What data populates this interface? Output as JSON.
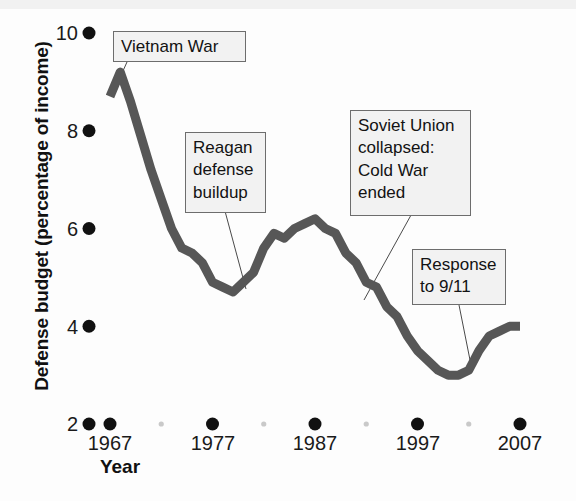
{
  "chart_data": {
    "type": "line",
    "title": "",
    "xlabel": "Year",
    "ylabel": "Defense budget (percentage of income)",
    "xlim": [
      1967,
      2007
    ],
    "ylim": [
      2,
      10
    ],
    "xticks": [
      1967,
      1977,
      1987,
      1997,
      2007
    ],
    "xtick_labels": [
      "1967",
      "1977",
      "1987",
      "1997",
      "2007"
    ],
    "yticks": [
      2,
      4,
      6,
      8,
      10
    ],
    "ytick_labels": [
      "2",
      "4",
      "6",
      "8",
      "10"
    ],
    "minor_xticks": [
      1972,
      1982,
      1992,
      2002
    ],
    "grid": false,
    "legend": null,
    "series": [
      {
        "name": "Defense budget",
        "color": "#575757",
        "x": [
          1967,
          1968,
          1969,
          1970,
          1971,
          1972,
          1973,
          1974,
          1975,
          1976,
          1977,
          1978,
          1979,
          1980,
          1981,
          1982,
          1983,
          1984,
          1985,
          1986,
          1987,
          1988,
          1989,
          1990,
          1991,
          1992,
          1993,
          1994,
          1995,
          1996,
          1997,
          1998,
          1999,
          2000,
          2001,
          2002,
          2003,
          2004,
          2005,
          2006,
          2007
        ],
        "y": [
          8.7,
          9.2,
          8.6,
          7.9,
          7.2,
          6.6,
          6.0,
          5.6,
          5.5,
          5.3,
          4.9,
          4.8,
          4.7,
          4.9,
          5.1,
          5.6,
          5.9,
          5.8,
          6.0,
          6.1,
          6.2,
          6.0,
          5.9,
          5.5,
          5.3,
          4.9,
          4.8,
          4.4,
          4.2,
          3.8,
          3.5,
          3.3,
          3.1,
          3.0,
          3.0,
          3.1,
          3.5,
          3.8,
          3.9,
          4.0,
          4.0
        ]
      }
    ],
    "annotations": [
      {
        "id": "vietnam-war",
        "text": "Vietnam War",
        "box": {
          "x": 113,
          "y": 31,
          "width": 133,
          "height": 31
        },
        "leader_to": {
          "x": 118,
          "y": 82
        }
      },
      {
        "id": "reagan-defense-buildup",
        "text": "Reagan\ndefense\nbuildup",
        "box": {
          "x": 185,
          "y": 132,
          "width": 81,
          "height": 81
        },
        "leader_to": {
          "x": 246,
          "y": 289
        }
      },
      {
        "id": "soviet-union-collapsed",
        "text": "Soviet Union\ncollapsed:\nCold War\nended",
        "box": {
          "x": 350,
          "y": 110,
          "width": 121,
          "height": 106
        },
        "leader_to": {
          "x": 364,
          "y": 300
        }
      },
      {
        "id": "response-to-911",
        "text": "Response\nto 9/11",
        "box": {
          "x": 412,
          "y": 249,
          "width": 94,
          "height": 56
        },
        "leader_to": {
          "x": 470,
          "y": 360
        }
      }
    ]
  },
  "axis": {
    "ylabel": "Defense budget (percentage of income)",
    "xlabel": "Year"
  },
  "ticks": {
    "y": [
      {
        "label": "10",
        "top": 22
      },
      {
        "label": "8",
        "top": 120
      },
      {
        "label": "6",
        "top": 218
      },
      {
        "label": "4",
        "top": 316
      },
      {
        "label": "2",
        "top": 413
      }
    ],
    "x": [
      {
        "label": "1967",
        "left": 70
      },
      {
        "label": "1977",
        "left": 173
      },
      {
        "label": "1987",
        "left": 275
      },
      {
        "label": "1997",
        "left": 378
      },
      {
        "label": "2007",
        "left": 480
      }
    ]
  },
  "annotations": {
    "vietnam": "Vietnam War",
    "reagan": "Reagan\ndefense\nbuildup",
    "soviet": "Soviet Union\ncollapsed:\nCold War\nended",
    "response": "Response\nto 9/11"
  },
  "colors": {
    "line": "#575757",
    "tick_dot": "#111111",
    "minor_tick_dot": "#c9c9c9",
    "callout_bg": "#f2f2f2",
    "callout_border": "#6d6d6d",
    "background": "#fdfdfd"
  }
}
